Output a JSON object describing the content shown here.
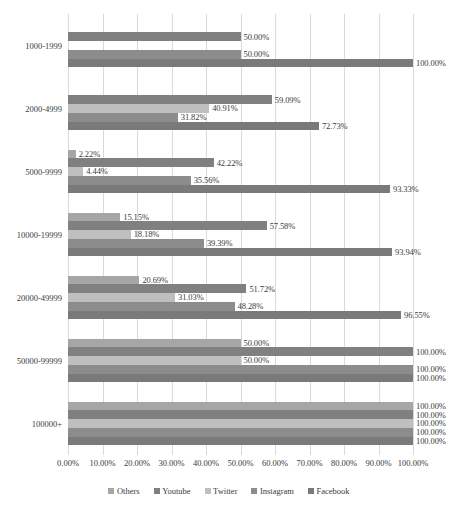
{
  "chart_data": {
    "type": "bar",
    "orientation": "horizontal",
    "title": "",
    "xlabel": "",
    "ylabel": "",
    "xlim": [
      0,
      100
    ],
    "xtick_labels": [
      "0.00%",
      "10.00%",
      "20.00%",
      "30.00%",
      "40.00%",
      "50.00%",
      "60.00%",
      "70.00%",
      "80.00%",
      "90.00%",
      "100.00%"
    ],
    "xticks": [
      0,
      10,
      20,
      30,
      40,
      50,
      60,
      70,
      80,
      90,
      100
    ],
    "grid": "vertical",
    "legend_position": "bottom",
    "categories": [
      "1000-1999",
      "2000-4999",
      "5000-9999",
      "10000-19999",
      "20000-49999",
      "50000-99999",
      "100000+"
    ],
    "series": [
      {
        "name": "Others",
        "color": "#A6A6A6",
        "values": [
          0,
          0,
          2.22,
          15.15,
          20.69,
          50.0,
          100.0
        ],
        "labels": [
          "",
          "",
          "2.22%",
          "15.15%",
          "20.69%",
          "50.00%",
          "100.00%"
        ]
      },
      {
        "name": "Youtube",
        "color": "#808080",
        "values": [
          50.0,
          59.09,
          42.22,
          57.58,
          51.72,
          100.0,
          100.0
        ],
        "labels": [
          "50.00%",
          "59.09%",
          "42.22%",
          "57.58%",
          "51.72%",
          "100.00%",
          "100.00%"
        ]
      },
      {
        "name": "Twitter",
        "color": "#BFBFBF",
        "values": [
          0,
          40.91,
          4.44,
          18.18,
          31.03,
          50.0,
          100.0
        ],
        "labels": [
          "",
          "40.91%",
          "4.44%",
          "18.18%",
          "31.03%",
          "50.00%",
          "100.00%"
        ]
      },
      {
        "name": "Instagram",
        "color": "#8C8C8C",
        "values": [
          50.0,
          31.82,
          35.56,
          39.39,
          48.28,
          100.0,
          100.0
        ],
        "labels": [
          "50.00%",
          "31.82%",
          "35.56%",
          "39.39%",
          "48.28%",
          "100.00%",
          "100.00%"
        ]
      },
      {
        "name": "Facebook",
        "color": "#7A7A7A",
        "values": [
          100.0,
          72.73,
          93.33,
          93.94,
          96.55,
          100.0,
          100.0
        ],
        "labels": [
          "100.00%",
          "72.73%",
          "93.33%",
          "93.94%",
          "96.55%",
          "100.00%",
          "100.00%"
        ]
      }
    ]
  }
}
